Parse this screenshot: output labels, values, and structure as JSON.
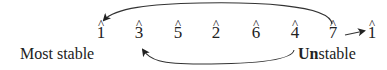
{
  "diagram": {
    "degrees": [
      {
        "num": "1",
        "hat": "^",
        "x": 101
      },
      {
        "num": "3",
        "hat": "^",
        "x": 139
      },
      {
        "num": "5",
        "hat": "^",
        "x": 178
      },
      {
        "num": "2",
        "hat": "^",
        "x": 216
      },
      {
        "num": "6",
        "hat": "^",
        "x": 256
      },
      {
        "num": "4",
        "hat": "^",
        "x": 295
      },
      {
        "num": "7",
        "hat": "^",
        "x": 333
      },
      {
        "num": "1",
        "hat": "^",
        "x": 372
      }
    ],
    "labels": {
      "left": "Most stable",
      "right_bold": "Un",
      "right_rest": "stable"
    },
    "arrows": [
      {
        "from": "7",
        "to": "1",
        "path": "over the top, right to left"
      },
      {
        "from": "4",
        "to": "3",
        "path": "underneath, right to left"
      },
      {
        "from": "7",
        "to": "1 (upper)",
        "path": "short straight arrow"
      }
    ],
    "colors": {
      "ink": "#222222",
      "background": "#ffffff"
    }
  }
}
